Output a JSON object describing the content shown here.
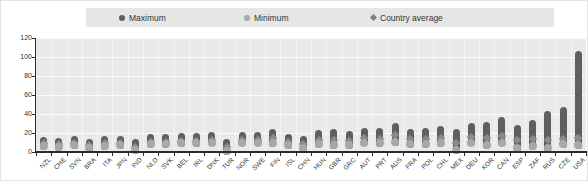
{
  "legend": {
    "background": "#e6e6e6",
    "items": [
      {
        "label": "Maximum",
        "marker": "circle",
        "color": "#5f5f5f",
        "offset_left": 33
      },
      {
        "label": "Minimum",
        "marker": "circle",
        "color": "#a8a8a8",
        "offset_left": 158
      },
      {
        "label": "Country average",
        "marker": "diamond",
        "color": "#7f7f7f",
        "offset_left": 285
      }
    ]
  },
  "chart_data": {
    "type": "scatter",
    "title": "",
    "xlabel": "",
    "ylabel": "",
    "ylim": [
      0,
      120
    ],
    "yticks": [
      0,
      20,
      40,
      60,
      80,
      100,
      120
    ],
    "grid": true,
    "legend_position": "top",
    "categories": [
      "NZL",
      "CHE",
      "SVN",
      "BRA",
      "ITA",
      "JPN",
      "IND",
      "NLD",
      "SVK",
      "BEL",
      "IRL",
      "DNK",
      "TUR",
      "NOR",
      "SWE",
      "FIN",
      "ISL",
      "CHN",
      "HUN",
      "GBR",
      "GRC",
      "AUT",
      "PRT",
      "AUS",
      "FRA",
      "POL",
      "CHL",
      "MEX",
      "DEU",
      "KOR",
      "CAN",
      "ESP",
      "ZAF",
      "RUS",
      "CZE",
      "USA"
    ],
    "series": [
      {
        "name": "Maximum",
        "values": [
          12,
          11,
          13,
          10,
          13,
          13,
          9,
          15,
          15,
          16,
          16,
          17,
          10,
          17,
          17,
          20,
          15,
          13,
          19,
          20,
          18,
          21,
          21,
          26,
          20,
          21,
          23,
          20,
          26,
          27,
          33,
          24,
          29,
          39,
          43,
          102
        ]
      },
      {
        "name": "Minimum",
        "values": [
          6,
          5,
          7,
          4,
          6,
          7,
          2,
          8,
          8,
          9,
          9,
          10,
          1,
          10,
          10,
          10,
          7,
          4,
          8,
          7,
          7,
          10,
          9,
          11,
          8,
          8,
          9,
          2,
          10,
          7,
          10,
          4,
          6,
          4,
          8,
          7
        ]
      },
      {
        "name": "Country average",
        "values": [
          9,
          8,
          10,
          7,
          9,
          10,
          5,
          11,
          11,
          12,
          12,
          13,
          5,
          13,
          13,
          15,
          11,
          8,
          13,
          13,
          12,
          15,
          14,
          18,
          14,
          14,
          15,
          10,
          16,
          15,
          17,
          13,
          14,
          13,
          14,
          15
        ]
      }
    ],
    "colors": {
      "maximum": "#5f5f5f",
      "minimum": "#a8a8a8",
      "average": "#8a8a8a",
      "plot_background": "#e9e9e9",
      "axis": "#2b2b2b",
      "tick_label": "#333333"
    }
  }
}
